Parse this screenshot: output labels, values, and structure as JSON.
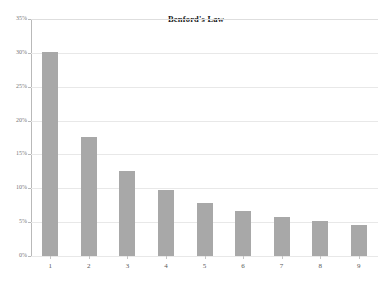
{
  "chart_data": {
    "type": "bar",
    "title": "Benford's Law",
    "xlabel": "",
    "ylabel": "",
    "categories": [
      "1",
      "2",
      "3",
      "4",
      "5",
      "6",
      "7",
      "8",
      "9"
    ],
    "values": [
      30.1,
      17.6,
      12.5,
      9.7,
      7.9,
      6.7,
      5.8,
      5.1,
      4.6
    ],
    "value_labels": [
      "30.1%",
      "17.6%",
      "12.5%",
      "9.7%",
      "7.9%",
      "6.7%",
      "5.8%",
      "5.1%",
      "4.6%"
    ],
    "ylim": [
      0,
      35
    ],
    "y_ticks": [
      0,
      5,
      10,
      15,
      20,
      25,
      30,
      35
    ],
    "y_tick_labels": [
      "0%",
      "5%",
      "10%",
      "15%",
      "20%",
      "25%",
      "30%",
      "35%"
    ],
    "grid": true,
    "legend": false,
    "legend_position": "none",
    "series": [
      {
        "name": "Benford's Law",
        "color": "#a8a8a8",
        "values": [
          30.1,
          17.6,
          12.5,
          9.7,
          7.9,
          6.7,
          5.8,
          5.1,
          4.6
        ]
      }
    ]
  },
  "colors": {
    "bar_fill": "#a8a8a8",
    "gridline": "#e8e8e8",
    "axis": "#b9b9b9",
    "title_text": "#1a1a1a",
    "tick_text": "#777777",
    "background": "#ffffff"
  }
}
